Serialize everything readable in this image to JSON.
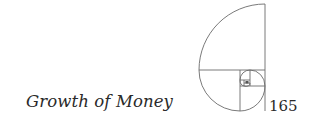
{
  "header": {
    "running_title": "Growth of Money",
    "page_number": "165"
  },
  "ornament": {
    "name": "golden-spiral",
    "stroke_color": "#6b6b6b"
  }
}
